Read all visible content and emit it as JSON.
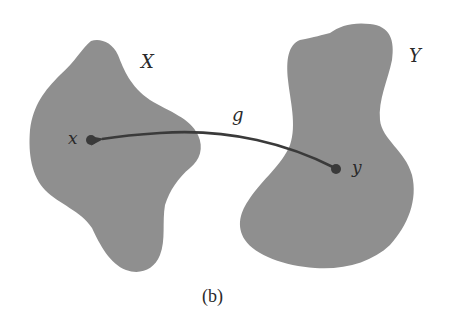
{
  "diagram": {
    "caption": "(b)",
    "colors": {
      "set_fill": "#8f8f8f",
      "arrow": "#3a3a3a",
      "point": "#3a3a3a",
      "text": "#2a2a2a",
      "background": "#ffffff"
    },
    "sets": [
      {
        "id": "X",
        "label": "X"
      },
      {
        "id": "Y",
        "label": "Y"
      }
    ],
    "points": [
      {
        "id": "x",
        "label": "x",
        "in_set": "X"
      },
      {
        "id": "y",
        "label": "y",
        "in_set": "Y"
      }
    ],
    "maps": [
      {
        "id": "g",
        "label": "g",
        "from": "y",
        "to": "x"
      }
    ]
  }
}
